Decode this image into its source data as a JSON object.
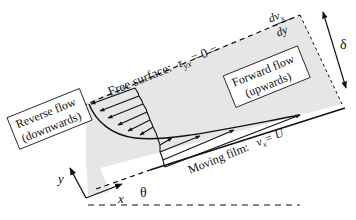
{
  "diagram": {
    "free_surface": {
      "label": "Free surface:",
      "tau_symbol": "τ",
      "tau_sub": "yx",
      "eq_mid": "= 0 =",
      "numerator": "dv",
      "numerator_sub": "x",
      "denominator": "dy"
    },
    "thickness_label": "δ",
    "forward_box": {
      "line1": "Forward flow",
      "line2": "(upwards)"
    },
    "reverse_box": {
      "line1": "Reverse flow",
      "line2": "(downwards)"
    },
    "moving_film": {
      "label": "Moving film:",
      "v": "v",
      "v_sub": "x",
      "eq": "= U"
    },
    "axes": {
      "x": "x",
      "y": "y",
      "angle": "θ"
    },
    "colors": {
      "band": "#e4e4e4",
      "ink": "#111111",
      "background": "#ffffff"
    }
  }
}
